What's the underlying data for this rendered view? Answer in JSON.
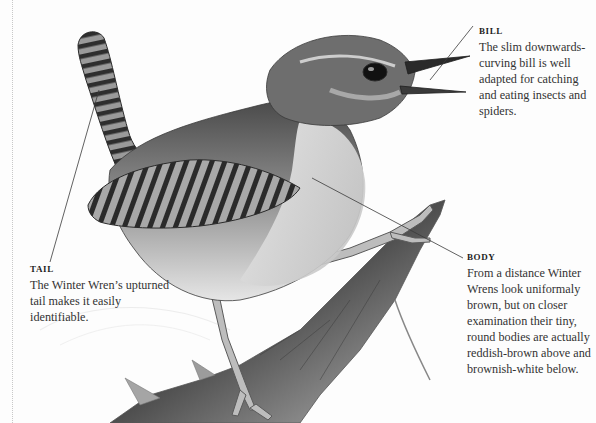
{
  "figure": {
    "subject": "Winter Wren",
    "illustration_style": "graphite pencil drawing"
  },
  "callouts": {
    "bill": {
      "title": "BILL",
      "text": "The slim downwards-curving bill is well adapted for catching and eating insects and spiders."
    },
    "tail": {
      "title": "TAIL",
      "text": "The Winter Wren’s upturned tail makes it easily identifiable."
    },
    "body": {
      "title": "BODY",
      "text": "From a distance Winter Wrens look uniformaly brown, but on closer examination their tiny, round bodies are actually reddish-brown above and brownish-white below."
    }
  },
  "colors": {
    "background": "#fdfdfd",
    "text": "#333333",
    "title": "#1e1e1e",
    "leader_line": "#3a3a3a",
    "margin_rule": "#c8c8c8"
  }
}
